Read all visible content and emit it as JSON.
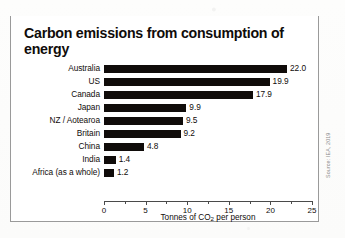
{
  "chart_data": {
    "type": "bar",
    "orientation": "horizontal",
    "title": "Carbon emissions from consumption of energy",
    "xlabel": "Tonnes of CO2 per person",
    "xlabel_parts": {
      "before": "Tonnes of CO",
      "sub": "2",
      "after": " per person"
    },
    "ylabel": "",
    "categories": [
      "Australia",
      "US",
      "Canada",
      "Japan",
      "NZ / Aotearoa",
      "Britain",
      "China",
      "India",
      "Africa (as a whole)"
    ],
    "values": [
      22.0,
      19.9,
      17.9,
      9.9,
      9.5,
      9.2,
      4.8,
      1.4,
      1.2
    ],
    "value_labels": [
      "22.0",
      "19.9",
      "17.9",
      "9.9",
      "9.5",
      "9.2",
      "4.8",
      "1.4",
      "1.2"
    ],
    "xlim": [
      0,
      25
    ],
    "xticks": [
      0,
      5,
      10,
      15,
      20,
      25
    ],
    "xtick_labels": [
      "0",
      "5",
      "10",
      "15",
      "20",
      "25"
    ],
    "xticks_minor": [
      2.5,
      7.5,
      12.5,
      17.5,
      22.5
    ],
    "grid": false,
    "legend": false,
    "bar_color": "#100c0a",
    "source": "Source: IEA, 2019"
  }
}
